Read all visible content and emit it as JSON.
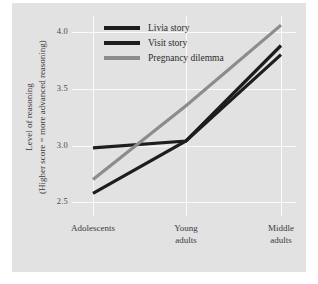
{
  "chart_data": {
    "type": "line",
    "title": "",
    "subtitle": "",
    "xlabel": "",
    "ylabel_line1": "Level of reasoning",
    "ylabel_line2": "(Higher score = more advanced reasoning)",
    "categories": [
      "Adolescents",
      "Young adults",
      "Middle adults"
    ],
    "category_lines": [
      [
        "Adolescents"
      ],
      [
        "Young",
        "adults"
      ],
      [
        "Middle",
        "adults"
      ]
    ],
    "ylim": [
      2.38,
      4.14
    ],
    "yticks": [
      4.0,
      3.5,
      3.0,
      2.5
    ],
    "ytick_labels": [
      "4.0",
      "3.5",
      "3.0",
      "2.5"
    ],
    "grid": true,
    "grid_color": "#fbfbfb",
    "legend_position": "top-left inside",
    "series": [
      {
        "name": "Livia story",
        "color": "#1d1d1d",
        "values": [
          2.98,
          3.04,
          3.88
        ]
      },
      {
        "name": "Visit story",
        "color": "#1d1d1d",
        "values": [
          2.58,
          3.04,
          3.8
        ]
      },
      {
        "name": "Pregnancy dilemma",
        "color": "#8c8c8c",
        "values": [
          2.7,
          3.35,
          4.06
        ]
      }
    ]
  },
  "legend": {
    "items": [
      {
        "label": "Livia story",
        "color": "#1d1d1d"
      },
      {
        "label": "Visit story",
        "color": "#1d1d1d"
      },
      {
        "label": "Pregnancy dilemma",
        "color": "#8c8c8c"
      }
    ]
  },
  "axes": {
    "y_tick_labels": [
      "4.0",
      "3.5",
      "3.0",
      "2.5"
    ],
    "x_tick_labels": [
      "Adolescents",
      "Young adults",
      "Middle adults"
    ],
    "y_title_line1": "Level of reasoning",
    "y_title_line2": "(Higher score = more advanced reasoning)"
  },
  "colors": {
    "background": "#ffffff",
    "panel": "#e2e2e2",
    "grid": "#fbfbfb",
    "series_black": "#1d1d1d",
    "series_gray": "#8c8c8c",
    "text": "#3a3a3a"
  }
}
